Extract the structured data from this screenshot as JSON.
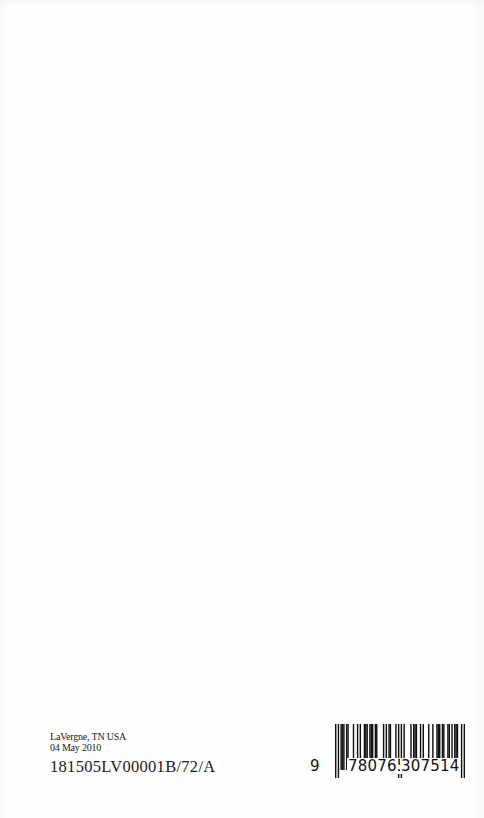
{
  "imprint": {
    "location": "LaVergne, TN USA",
    "date": "04 May 2010",
    "print_code": "181505LV00001B/72/A"
  },
  "barcode": {
    "type": "EAN-13 (ISBN)",
    "value": "9780765307514",
    "lead_digit": "9",
    "left_group": "780765",
    "right_group": "307514",
    "bar_color": "#111111"
  }
}
